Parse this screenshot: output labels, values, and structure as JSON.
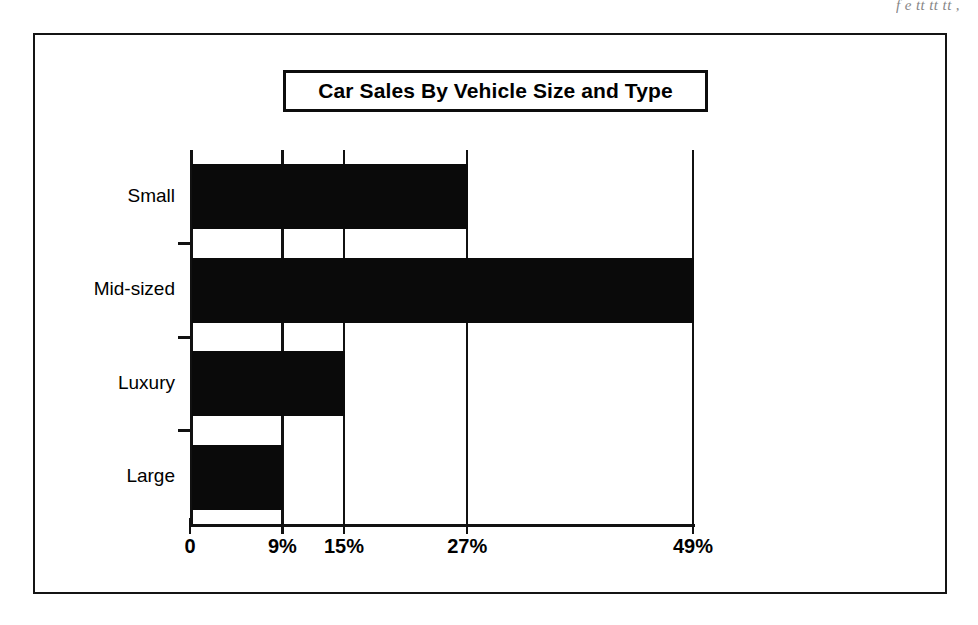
{
  "page": {
    "bleed_caption": "f                       e tt  tt   tt ,"
  },
  "figure": {
    "title": "Car Sales By Vehicle Size and Type"
  },
  "chart_data": {
    "type": "bar",
    "orientation": "horizontal",
    "title": "Car Sales By Vehicle Size and Type",
    "xlabel": "",
    "ylabel": "",
    "categories": [
      "Small",
      "Mid-sized",
      "Luxury",
      "Large"
    ],
    "values": [
      27,
      49,
      15,
      9
    ],
    "value_unit": "%",
    "xlim": [
      0,
      49
    ],
    "ylim": null,
    "xticks": [
      0,
      9,
      15,
      27,
      49
    ],
    "xtick_labels": [
      "0",
      "9%",
      "15%",
      "27%",
      "49%"
    ],
    "grid": true,
    "grid_axis": "x",
    "legend": false,
    "legend_position": "none",
    "bar_color": "#0a0a0a",
    "series": [
      {
        "name": "Car Sales",
        "values": [
          27,
          49,
          15,
          9
        ]
      }
    ],
    "points": [
      {
        "category": "Small",
        "value": 27,
        "label": "27%"
      },
      {
        "category": "Mid-sized",
        "value": 49,
        "label": "49%"
      },
      {
        "category": "Luxury",
        "value": 15,
        "label": "15%"
      },
      {
        "category": "Large",
        "value": 9,
        "label": "9%"
      }
    ]
  },
  "colors": {
    "bar": "#0a0a0a",
    "axis": "#111111",
    "frame": "#141414",
    "background": "#ffffff"
  }
}
